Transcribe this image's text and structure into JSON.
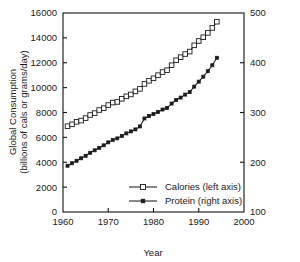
{
  "chart_data": {
    "type": "line",
    "title": "",
    "xlabel": "Year",
    "ylabel": "Global Consumption (billions of cals or grams/day)",
    "ylabel_line1": "Global Consumption",
    "ylabel_line2": "(billions of cals or grams/day)",
    "y2label": "",
    "grid": false,
    "legend_position": "inside lower-center-right",
    "xlim": [
      1960,
      2000
    ],
    "ylim": [
      0,
      16000
    ],
    "y2lim": [
      100,
      500
    ],
    "xticks": [
      1960,
      1970,
      1980,
      1990,
      2000
    ],
    "xtick_labels": [
      "1960",
      "1970",
      "1980",
      "1990",
      "2000"
    ],
    "yticks": [
      0,
      2000,
      4000,
      6000,
      8000,
      10000,
      12000,
      14000,
      16000
    ],
    "ytick_labels": [
      "0",
      "2000",
      "4000",
      "6000",
      "8000",
      "10000",
      "12000",
      "14000",
      "16000"
    ],
    "y2ticks": [
      100,
      200,
      300,
      400,
      500
    ],
    "y2tick_labels": [
      "100",
      "200",
      "300",
      "400",
      "500"
    ],
    "x": [
      1961,
      1962,
      1963,
      1964,
      1965,
      1966,
      1967,
      1968,
      1969,
      1970,
      1971,
      1972,
      1973,
      1974,
      1975,
      1976,
      1977,
      1978,
      1979,
      1980,
      1981,
      1982,
      1983,
      1984,
      1985,
      1986,
      1987,
      1988,
      1989,
      1990,
      1991,
      1992,
      1993,
      1994
    ],
    "series": [
      {
        "name": "Calories (left axis)",
        "axis": "left",
        "marker": "open-square",
        "values": [
          6900,
          7050,
          7250,
          7350,
          7550,
          7800,
          7950,
          8200,
          8350,
          8600,
          8800,
          8850,
          9100,
          9300,
          9450,
          9700,
          9900,
          10300,
          10550,
          10750,
          11000,
          11250,
          11400,
          11800,
          12200,
          12450,
          12700,
          12900,
          13400,
          13750,
          14050,
          14400,
          14800,
          15300
        ]
      },
      {
        "name": "Protein (right axis)",
        "axis": "right",
        "marker": "filled-cross",
        "values": [
          193,
          198,
          203,
          208,
          213,
          219,
          224,
          229,
          234,
          240,
          245,
          248,
          253,
          258,
          262,
          266,
          272,
          288,
          293,
          297,
          301,
          306,
          309,
          318,
          325,
          330,
          336,
          341,
          352,
          362,
          372,
          383,
          395,
          410
        ]
      }
    ],
    "legend": [
      {
        "label": "Calories (left axis)",
        "marker": "open-square"
      },
      {
        "label": "Protein (right axis)",
        "marker": "filled-cross"
      }
    ],
    "colors": {
      "line": "#1b1b1b",
      "axis": "#111111",
      "background": "#ffffff",
      "text": "#1a1a1a"
    }
  }
}
